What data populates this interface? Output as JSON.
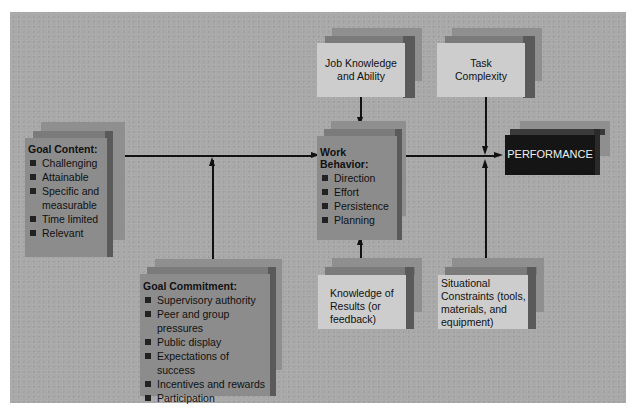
{
  "diagram": {
    "type": "goal-setting model flow diagram",
    "goal_content": {
      "title": "Goal Content:",
      "items": [
        "Challenging",
        "Attainable",
        "Specific and measurable",
        "Time limited",
        "Relevant"
      ]
    },
    "goal_commitment": {
      "title": "Goal Commitment:",
      "items": [
        "Supervisory authority",
        "Peer and group pressures",
        "Public display",
        "Expectations of success",
        "Incentives and rewards",
        "Participation"
      ]
    },
    "work_behavior": {
      "title": "Work Behavior:",
      "items": [
        "Direction",
        "Effort",
        "Persistence",
        "Planning"
      ]
    },
    "job_knowledge": {
      "line1": "Job Knowledge",
      "line2": "and Ability"
    },
    "task_complexity": {
      "line1": "Task",
      "line2": "Complexity"
    },
    "knowledge_of_results": {
      "line1": "Knowledge of",
      "line2": "Results (or",
      "line3": "feedback)"
    },
    "situational_constraints": {
      "line1": "Situational",
      "line2": "Constraints (tools,",
      "line3": "materials, and",
      "line4": "equipment)"
    },
    "performance": {
      "label": "PERFORMANCE"
    },
    "colors": {
      "background": "#a9a9a9",
      "dark_box": "#8c8c8c",
      "light_box": "#cdcdcd",
      "performance_box": "#151515"
    },
    "edges": [
      [
        "Goal Content",
        "Work Behavior"
      ],
      [
        "Goal Commitment",
        "Goal Content->Work Behavior"
      ],
      [
        "Job Knowledge and Ability",
        "Work Behavior"
      ],
      [
        "Knowledge of Results",
        "Work Behavior"
      ],
      [
        "Work Behavior",
        "PERFORMANCE"
      ],
      [
        "Task Complexity",
        "Work Behavior->PERFORMANCE"
      ],
      [
        "Situational Constraints",
        "Work Behavior->PERFORMANCE"
      ]
    ]
  }
}
